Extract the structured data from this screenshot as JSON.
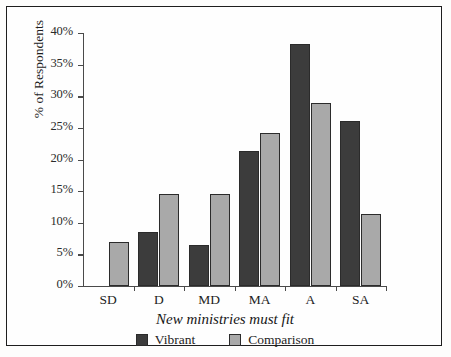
{
  "chart_data": {
    "type": "bar",
    "title": "",
    "xlabel": "New ministries must fit",
    "ylabel": "% of Respondents",
    "categories": [
      "SD",
      "D",
      "MD",
      "MA",
      "A",
      "SA"
    ],
    "series": [
      {
        "name": "Vibrant",
        "color": "#3c3c3c",
        "values": [
          0,
          8.6,
          6.5,
          21.3,
          38.3,
          26.1
        ]
      },
      {
        "name": "Comparison",
        "color": "#a9a9a9",
        "values": [
          7.0,
          14.5,
          14.5,
          24.2,
          29.0,
          11.4
        ]
      }
    ],
    "ylim": [
      0,
      40
    ],
    "ytick_labels": [
      "0%",
      "5%",
      "10%",
      "15%",
      "20%",
      "25%",
      "30%",
      "35%",
      "40%"
    ],
    "ytick_values": [
      0,
      5,
      10,
      15,
      20,
      25,
      30,
      35,
      40
    ],
    "grid": false,
    "legend_position": "bottom"
  },
  "legend": {
    "entries": [
      {
        "label": "Vibrant"
      },
      {
        "label": "Comparison"
      }
    ]
  }
}
